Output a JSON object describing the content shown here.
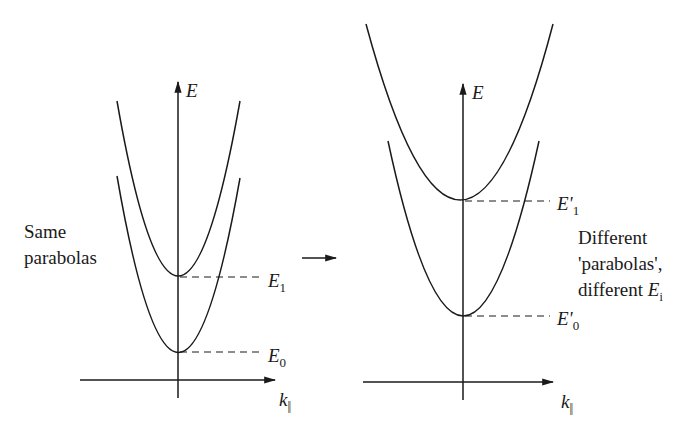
{
  "left_panel": {
    "axis_y_label": "E",
    "axis_x_label": "k",
    "axis_x_sub": "||",
    "caption_lines": [
      "Same",
      "parabolas"
    ],
    "levels": [
      {
        "name": "E",
        "sub": "1"
      },
      {
        "name": "E",
        "sub": "0"
      }
    ]
  },
  "right_panel": {
    "axis_y_label": "E",
    "axis_x_label": "k",
    "axis_x_sub": "||",
    "caption_lines": [
      "Different",
      "'parabolas',",
      "different "
    ],
    "caption_E": "E",
    "caption_E_sub": "i",
    "levels": [
      {
        "name": "E'",
        "sub": "1"
      },
      {
        "name": "E'",
        "sub": "0"
      }
    ]
  },
  "transition_arrow": "right-arrow",
  "colors": {
    "line": "#1a1a1a",
    "background": "#ffffff"
  }
}
